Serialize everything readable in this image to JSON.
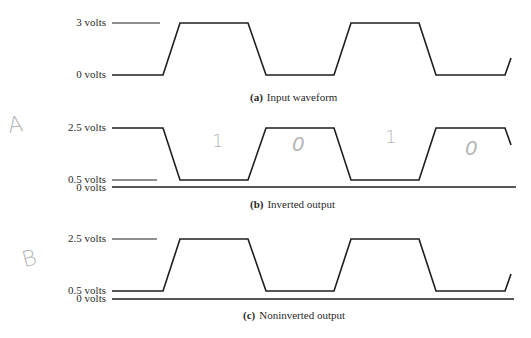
{
  "panels": [
    {
      "id": "a",
      "caption_letter": "(a)",
      "caption_text": "Input waveform",
      "levels": {
        "high": "3 volts",
        "low": "0 volts"
      }
    },
    {
      "id": "b",
      "caption_letter": "(b)",
      "caption_text": "Inverted output",
      "levels": {
        "high": "2.5 volts",
        "low": "0.5 volts",
        "zero": "0 volts"
      }
    },
    {
      "id": "c",
      "caption_letter": "(c)",
      "caption_text": "Noninverted output",
      "levels": {
        "high": "2.5 volts",
        "low": "0.5 volts",
        "zero": "0 volts"
      }
    }
  ],
  "handwriting": {
    "label_a": "A",
    "label_b": "B",
    "bits": [
      "1",
      "0",
      "1",
      "0"
    ]
  },
  "colors": {
    "line": "#1e1e1e",
    "handwriting": "#b5b5b5"
  }
}
